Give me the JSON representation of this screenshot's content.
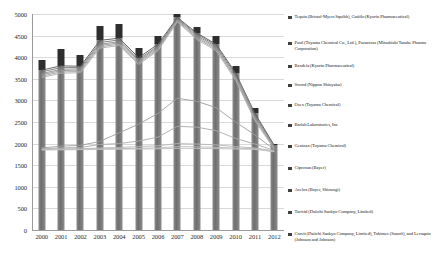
{
  "chart_data": {
    "type": "bar",
    "title": "",
    "subtitle": "",
    "xlabel": "",
    "ylabel": "",
    "categories": [
      "2000",
      "2001",
      "2002",
      "2003",
      "2004",
      "2005",
      "2006",
      "2007",
      "2008",
      "2009",
      "2010",
      "2011",
      "2012"
    ],
    "ylim": [
      0,
      5000
    ],
    "yticks": [
      0,
      500,
      1000,
      1500,
      2000,
      2500,
      3000,
      3500,
      4000,
      4500,
      5000
    ],
    "ytick_labels": [
      "0",
      "500",
      "1000",
      "1500",
      "2000",
      "2500",
      "3000",
      "3500",
      "4000",
      "4500",
      "5000"
    ],
    "grid": true,
    "legend_position": "right",
    "bar_totals": [
      3925,
      4200,
      4050,
      4730,
      4760,
      4210,
      4490,
      5000,
      4700,
      4480,
      3790,
      2820,
      2000
    ],
    "bar_base_values": [
      3700,
      3800,
      3790,
      4390,
      4440,
      3990,
      4300,
      4920,
      4560,
      4300,
      3640,
      2700,
      1960
    ],
    "series": [
      {
        "name": "Tequin (Bristol-Myers Squibb), Gatiflo (Kyorin Pharmaceutical)",
        "values": [
          3700,
          3800,
          3790,
          4390,
          4440,
          3990,
          4300,
          4920,
          4560,
          4300,
          3640,
          2700,
          1960
        ]
      },
      {
        "name": "Pasil (Toyama Chemical Co., Ltd.), Pazucross (Mitsubishi Tanabe Pharma Corporation)",
        "values": [
          3660,
          3760,
          3760,
          4340,
          4400,
          3950,
          4260,
          4900,
          4530,
          4270,
          3600,
          2660,
          1940
        ]
      },
      {
        "name": "Baxdela (Kyorin Pharmaceutical)",
        "values": [
          3620,
          3720,
          3730,
          4300,
          4360,
          3920,
          4230,
          4880,
          4500,
          4240,
          3560,
          2620,
          1920
        ]
      },
      {
        "name": "Sword (Nippon Shinyaku)",
        "values": [
          3590,
          3690,
          3700,
          4270,
          4330,
          3890,
          4200,
          4860,
          4470,
          4210,
          3530,
          2590,
          1900
        ]
      },
      {
        "name": "Ozex (Toyama Chemical)",
        "values": [
          3560,
          3660,
          3670,
          4240,
          4300,
          3860,
          4180,
          4840,
          4440,
          4180,
          3500,
          2560,
          1880
        ]
      },
      {
        "name": "Barlab Laboratories, Inc",
        "values": [
          3530,
          3630,
          3640,
          4210,
          4270,
          3830,
          4150,
          4820,
          4410,
          4150,
          3470,
          2530,
          1870
        ]
      },
      {
        "name": "Geninax (Toyama Chemical)",
        "values": [
          1900,
          1940,
          1960,
          2050,
          2250,
          2450,
          2700,
          3050,
          2980,
          2830,
          2500,
          2200,
          1860
        ]
      },
      {
        "name": "Ciproxan (Bayer)",
        "values": [
          1880,
          1900,
          1910,
          1980,
          2000,
          2060,
          2150,
          2400,
          2380,
          2300,
          2120,
          1990,
          1840
        ]
      },
      {
        "name": "Avelox (Bayer, Shionogi)",
        "values": [
          1870,
          1880,
          1880,
          1900,
          1910,
          1930,
          1950,
          2000,
          1990,
          1970,
          1930,
          1900,
          1830
        ]
      },
      {
        "name": "Tarivid (Daiichi Sankyo Company, Limited)",
        "values": [
          1860,
          1870,
          1870,
          1880,
          1885,
          1890,
          1900,
          1930,
          1925,
          1915,
          1895,
          1880,
          1820
        ]
      },
      {
        "name": "Cravit (Daiichi Sankyo Company, Limited), Tobimec (Sanofi), and Levaquin (Johnson and Johnson)",
        "values": [
          1850,
          1855,
          1860,
          1865,
          1870,
          1875,
          1880,
          1890,
          1888,
          1885,
          1875,
          1865,
          1810
        ]
      }
    ]
  },
  "legend": {
    "items": [
      {
        "label": "Tequin (Bristol-Myers Squibb), Gatiflo (Kyorin Pharmaceutical)"
      },
      {
        "label": "Pasil (Toyama Chemical Co., Ltd.), Pazucross (Mitsubishi Tanabe Pharma Corporation)"
      },
      {
        "label": "Baxdela (Kyorin Pharmaceutical)"
      },
      {
        "label": "Sword (Nippon Shinyaku)"
      },
      {
        "label": "Ozex (Toyama Chemical)"
      },
      {
        "label": "Barlab Laboratories, Inc"
      },
      {
        "label": "Geninax (Toyama Chemical)"
      },
      {
        "label": "Ciproxan (Bayer)"
      },
      {
        "label": "Avelox (Bayer, Shionogi)"
      },
      {
        "label": "Tarivid (Daiichi Sankyo Company, Limited)"
      },
      {
        "label": "Cravit (Daiichi Sankyo Company, Limited), Tobimec (Sanofi), and Levaquin (Johnson and Johnson)"
      }
    ]
  },
  "colors": {
    "bar_dark": "#2e2e2e",
    "bar_mid": "#6e6e6e",
    "bar_light": "#8c8c8c",
    "grid": "#d9d9d9",
    "axis": "#9a9a9a",
    "text": "#1a1a1a"
  }
}
